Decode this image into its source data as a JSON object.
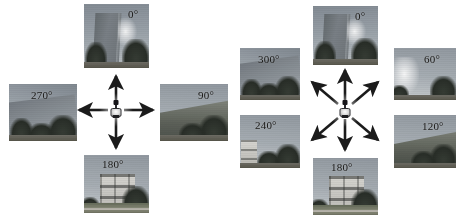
{
  "figure": {
    "background_color": "#ffffff",
    "width": 463,
    "height": 220,
    "panels": [
      {
        "id": "four-view",
        "name": "four-direction-capture-panel",
        "arrow_count": 4,
        "angle_step_deg": 90,
        "center_actor": "mobile-robot-with-camera",
        "views": [
          {
            "id": "left-0",
            "label": "0°",
            "heading_deg": 0,
            "direction": "up",
            "scene": "tall-office-tower-with-sun-glare-and-trees",
            "rect": {
              "x": 84,
              "y": 4,
              "w": 65,
              "h": 64
            },
            "label_pos": {
              "x": 44,
              "y": 5
            }
          },
          {
            "id": "left-90",
            "label": "90°",
            "heading_deg": 90,
            "direction": "right",
            "scene": "open-sky-with-tree-line",
            "rect": {
              "x": 160,
              "y": 84,
              "w": 68,
              "h": 57
            },
            "label_pos": {
              "x": 38,
              "y": 6
            }
          },
          {
            "id": "left-180",
            "label": "180°",
            "heading_deg": 180,
            "direction": "down",
            "scene": "apartment-block-with-lawn-and-trees",
            "rect": {
              "x": 84,
              "y": 155,
              "w": 65,
              "h": 58
            },
            "label_pos": {
              "x": 18,
              "y": 4
            }
          },
          {
            "id": "left-270",
            "label": "270°",
            "heading_deg": 270,
            "direction": "left",
            "scene": "sloped-building-edge-with-sky-and-trees",
            "rect": {
              "x": 9,
              "y": 84,
              "w": 68,
              "h": 57
            },
            "label_pos": {
              "x": 22,
              "y": 6
            }
          }
        ],
        "center": {
          "x": 116,
          "y": 110
        }
      },
      {
        "id": "six-view",
        "name": "six-direction-capture-panel",
        "arrow_count": 6,
        "angle_step_deg": 60,
        "center_actor": "mobile-robot-with-camera",
        "views": [
          {
            "id": "right-0",
            "label": "0°",
            "heading_deg": 0,
            "direction": "up",
            "scene": "tall-office-tower-with-sun-glare-and-trees",
            "rect": {
              "x": 313,
              "y": 6,
              "w": 65,
              "h": 59
            },
            "label_pos": {
              "x": 42,
              "y": 5
            }
          },
          {
            "id": "right-60",
            "label": "60°",
            "heading_deg": 60,
            "direction": "up-right",
            "scene": "sky-with-sun-glare-and-tree-silhouettes",
            "rect": {
              "x": 394,
              "y": 48,
              "w": 62,
              "h": 52
            },
            "label_pos": {
              "x": 30,
              "y": 6
            }
          },
          {
            "id": "right-120",
            "label": "120°",
            "heading_deg": 120,
            "direction": "down-right",
            "scene": "open-sky-with-dense-tree-line",
            "rect": {
              "x": 394,
              "y": 115,
              "w": 62,
              "h": 53
            },
            "label_pos": {
              "x": 28,
              "y": 6
            }
          },
          {
            "id": "right-180",
            "label": "180°",
            "heading_deg": 180,
            "direction": "down",
            "scene": "apartment-block-with-lawn-and-trees",
            "rect": {
              "x": 313,
              "y": 158,
              "w": 65,
              "h": 57
            },
            "label_pos": {
              "x": 18,
              "y": 4
            }
          },
          {
            "id": "right-240",
            "label": "240°",
            "heading_deg": 240,
            "direction": "down-left",
            "scene": "low-residential-block-with-trees",
            "rect": {
              "x": 240,
              "y": 115,
              "w": 60,
              "h": 53
            },
            "label_pos": {
              "x": 15,
              "y": 5
            }
          },
          {
            "id": "right-300",
            "label": "300°",
            "heading_deg": 300,
            "direction": "up-left",
            "scene": "sloped-building-edge-with-sky-and-trees",
            "rect": {
              "x": 240,
              "y": 48,
              "w": 60,
              "h": 52
            },
            "label_pos": {
              "x": 18,
              "y": 6
            }
          }
        ],
        "center": {
          "x": 345,
          "y": 110
        }
      }
    ]
  },
  "style": {
    "arrow_color": "#1b1b1b",
    "label_color": "#15130f",
    "page_background": "#ffffff"
  }
}
